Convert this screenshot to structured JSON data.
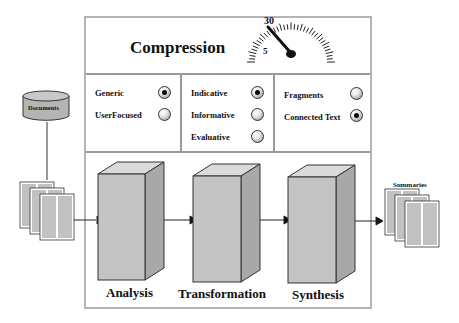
{
  "title": "Compression",
  "gauge": {
    "labels": [
      "5",
      "30"
    ],
    "needle_value": "30"
  },
  "groups": [
    {
      "name": "audience",
      "options": [
        {
          "label": "Generic",
          "selected": true
        },
        {
          "label": "UserFocused",
          "selected": false
        }
      ]
    },
    {
      "name": "function",
      "options": [
        {
          "label": "Indicative",
          "selected": true
        },
        {
          "label": "Informative",
          "selected": false
        },
        {
          "label": "Evaluative",
          "selected": false
        }
      ]
    },
    {
      "name": "coherence",
      "options": [
        {
          "label": "Fragments",
          "selected": false
        },
        {
          "label": "Connected Text",
          "selected": true
        }
      ]
    }
  ],
  "input": {
    "source_label": "Documents"
  },
  "output": {
    "label": "Summaries"
  },
  "stages": [
    {
      "label": "Analysis"
    },
    {
      "label": "Transformation"
    },
    {
      "label": "Synthesis"
    }
  ],
  "colors": {
    "box_front": "#c4c4c4",
    "box_side": "#a8a8a8",
    "box_top": "#dadada",
    "frame": "#b4b4b4"
  }
}
